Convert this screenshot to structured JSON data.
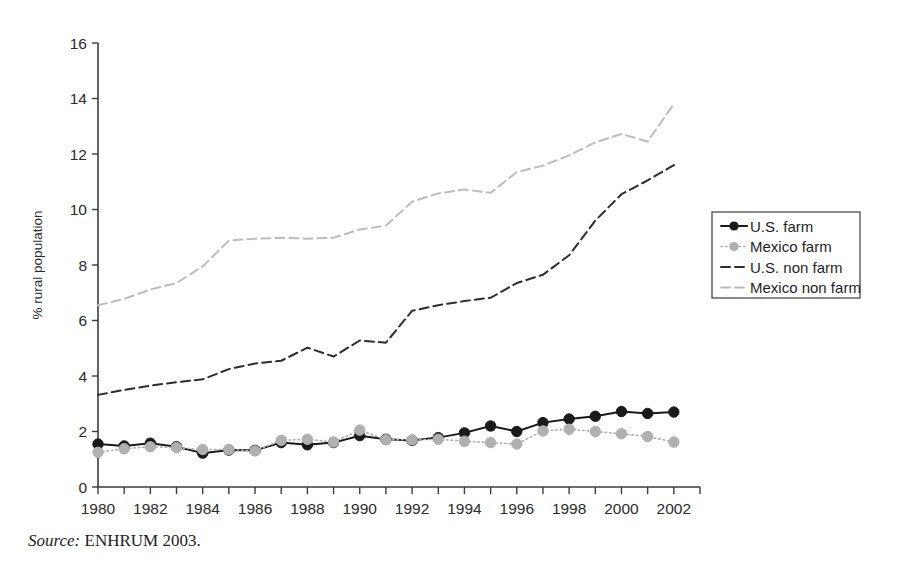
{
  "figure": {
    "source_prefix": "Source:",
    "source_text": "ENHRUM 2003."
  },
  "chart_data": {
    "type": "line",
    "title": "",
    "xlabel": "",
    "ylabel": "% rural population",
    "xlim": [
      1980,
      2003
    ],
    "ylim": [
      0,
      16
    ],
    "grid": false,
    "legend_position": "right",
    "x_tick_labels": [
      "1980",
      "1982",
      "1984",
      "1986",
      "1988",
      "1990",
      "1992",
      "1994",
      "1996",
      "1998",
      "2000",
      "2002"
    ],
    "x_tick_values": [
      1980,
      1982,
      1984,
      1986,
      1988,
      1990,
      1992,
      1994,
      1996,
      1998,
      2000,
      2002
    ],
    "x_minor_ticks": [
      1980,
      1981,
      1982,
      1983,
      1984,
      1985,
      1986,
      1987,
      1988,
      1989,
      1990,
      1991,
      1992,
      1993,
      1994,
      1995,
      1996,
      1997,
      1998,
      1999,
      2000,
      2001,
      2002,
      2003
    ],
    "y_tick_labels": [
      "0",
      "2",
      "4",
      "6",
      "8",
      "10",
      "12",
      "14",
      "16"
    ],
    "y_tick_values": [
      0,
      2,
      4,
      6,
      8,
      10,
      12,
      14,
      16
    ],
    "x": [
      1980,
      1981,
      1982,
      1983,
      1984,
      1985,
      1986,
      1987,
      1988,
      1989,
      1990,
      1991,
      1992,
      1993,
      1994,
      1995,
      1996,
      1997,
      1998,
      1999,
      2000,
      2001,
      2002
    ],
    "series": [
      {
        "name": "U.S. farm",
        "color": "#1a1a1a",
        "style": "solid",
        "marker": "circle",
        "values": [
          1.55,
          1.48,
          1.58,
          1.45,
          1.22,
          1.33,
          1.32,
          1.6,
          1.52,
          1.6,
          1.85,
          1.72,
          1.68,
          1.78,
          1.95,
          2.2,
          2.0,
          2.32,
          2.45,
          2.55,
          2.72,
          2.65,
          2.7
        ]
      },
      {
        "name": "Mexico farm",
        "color": "#b0b0b0",
        "style": "dotted",
        "marker": "circle",
        "values": [
          1.25,
          1.38,
          1.45,
          1.42,
          1.35,
          1.35,
          1.3,
          1.68,
          1.72,
          1.62,
          2.05,
          1.7,
          1.7,
          1.72,
          1.65,
          1.6,
          1.55,
          2.02,
          2.08,
          2.0,
          1.92,
          1.82,
          1.62
        ]
      },
      {
        "name": "U.S. non farm",
        "color": "#2e2e2e",
        "style": "dashed",
        "marker": "none",
        "values": [
          3.32,
          3.5,
          3.65,
          3.78,
          3.88,
          4.25,
          4.45,
          4.55,
          5.02,
          4.7,
          5.28,
          5.2,
          6.35,
          6.55,
          6.7,
          6.82,
          7.35,
          7.65,
          8.35,
          9.6,
          10.55,
          11.05,
          11.6
        ]
      },
      {
        "name": "Mexico non farm",
        "color": "#bdbdbd",
        "style": "dashed",
        "marker": "none",
        "values": [
          6.55,
          6.78,
          7.12,
          7.35,
          7.95,
          8.88,
          8.95,
          8.98,
          8.95,
          8.98,
          9.28,
          9.42,
          10.28,
          10.58,
          10.72,
          10.6,
          11.35,
          11.58,
          11.95,
          12.42,
          12.72,
          12.45,
          13.8
        ]
      }
    ]
  },
  "legend": {
    "items": [
      {
        "label": "U.S. farm"
      },
      {
        "label": "Mexico farm"
      },
      {
        "label": "U.S. non farm"
      },
      {
        "label": "Mexico non farm"
      }
    ]
  }
}
